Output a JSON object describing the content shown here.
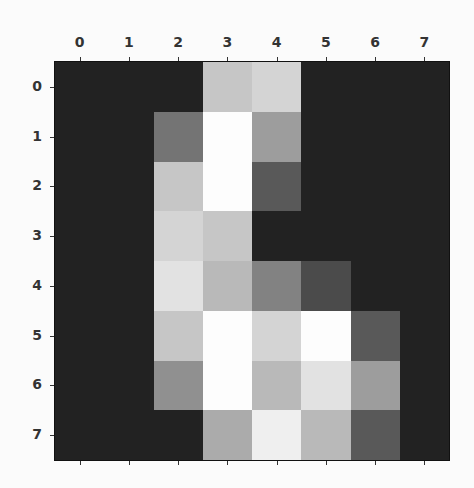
{
  "chart_data": {
    "type": "heatmap",
    "title": "",
    "xlabel": "",
    "ylabel": "",
    "colormap": "gray",
    "value_range": [
      0,
      16
    ],
    "x_tick_labels": [
      "0",
      "1",
      "2",
      "3",
      "4",
      "5",
      "6",
      "7"
    ],
    "y_tick_labels": [
      "0",
      "1",
      "2",
      "3",
      "4",
      "5",
      "6",
      "7"
    ],
    "x_ticks_position": "top",
    "grid": false,
    "values": [
      [
        0,
        0,
        0,
        12,
        13,
        0,
        0,
        0
      ],
      [
        0,
        0,
        6,
        16,
        9,
        0,
        0,
        0
      ],
      [
        0,
        0,
        12,
        16,
        4,
        0,
        0,
        0
      ],
      [
        0,
        0,
        13,
        12,
        0,
        0,
        0,
        0
      ],
      [
        0,
        0,
        14,
        11,
        7,
        3,
        0,
        0
      ],
      [
        0,
        0,
        12,
        16,
        13,
        16,
        4,
        0
      ],
      [
        0,
        0,
        8,
        16,
        11,
        14,
        9,
        0
      ],
      [
        0,
        0,
        0,
        10,
        15,
        11,
        4,
        0
      ]
    ]
  }
}
